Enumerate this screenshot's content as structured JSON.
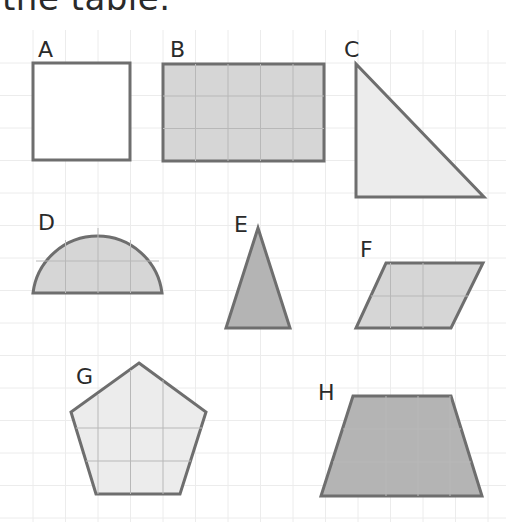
{
  "caption": "the table.",
  "colors": {
    "outline": "#6e6e6e",
    "grid": "#ececec",
    "fill_white": "#ffffff",
    "fill_light": "#ececec",
    "fill_medium": "#d6d6d6",
    "fill_dark": "#b4b4b4"
  },
  "shapes": [
    {
      "label": "A",
      "name": "square",
      "fill": "white"
    },
    {
      "label": "B",
      "name": "rectangle",
      "fill": "medium"
    },
    {
      "label": "C",
      "name": "right-triangle",
      "fill": "light"
    },
    {
      "label": "D",
      "name": "semicircle",
      "fill": "medium"
    },
    {
      "label": "E",
      "name": "isosceles-triangle",
      "fill": "dark"
    },
    {
      "label": "F",
      "name": "parallelogram",
      "fill": "medium"
    },
    {
      "label": "G",
      "name": "pentagon",
      "fill": "light"
    },
    {
      "label": "H",
      "name": "trapezium",
      "fill": "dark"
    }
  ]
}
